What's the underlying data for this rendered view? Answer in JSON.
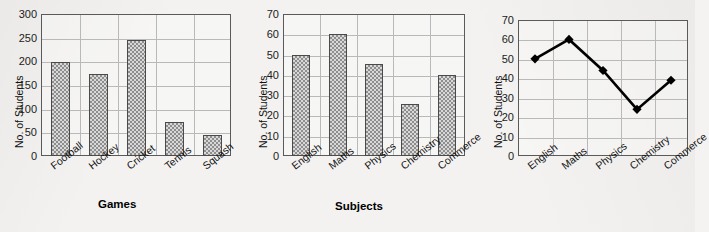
{
  "page": {
    "background": "#f3f2f0"
  },
  "chart_data": [
    {
      "type": "bar",
      "title": "",
      "xlabel": "Games",
      "ylabel": "No. of Students",
      "categories": [
        "Football",
        "Hockey",
        "Cricket",
        "Tennis",
        "Squash"
      ],
      "values": [
        198,
        173,
        246,
        72,
        44
      ],
      "ylim": [
        0,
        300
      ],
      "yticks": [
        0,
        50,
        100,
        150,
        200,
        250,
        300
      ],
      "grid": true,
      "legend": "none",
      "bar_fill": "#d8d8d8",
      "bar_pattern": "checkerboard",
      "bar_border": "#4a4a4a"
    },
    {
      "type": "bar",
      "title": "",
      "xlabel": "Subjects",
      "ylabel": "No. of Students",
      "categories": [
        "English",
        "Maths",
        "Physics",
        "Chemistry",
        "Commerce"
      ],
      "values": [
        50,
        60,
        45.5,
        25.5,
        40
      ],
      "ylim": [
        0,
        70
      ],
      "yticks": [
        0,
        10,
        20,
        30,
        40,
        50,
        60,
        70
      ],
      "grid": true,
      "legend": "none",
      "bar_fill": "#d8d8d8",
      "bar_pattern": "checkerboard",
      "bar_border": "#4a4a4a"
    },
    {
      "type": "line",
      "title": "",
      "xlabel": "",
      "ylabel": "No. of Students",
      "categories": [
        "English",
        "Maths",
        "Physics",
        "Chemistry",
        "Commerce"
      ],
      "values": [
        50,
        60,
        44,
        24,
        39
      ],
      "ylim": [
        0,
        70
      ],
      "yticks": [
        0,
        10,
        20,
        30,
        40,
        50,
        60,
        70
      ],
      "grid": true,
      "legend": "none",
      "line_color": "#000000",
      "marker": "diamond",
      "marker_color": "#000000"
    }
  ]
}
